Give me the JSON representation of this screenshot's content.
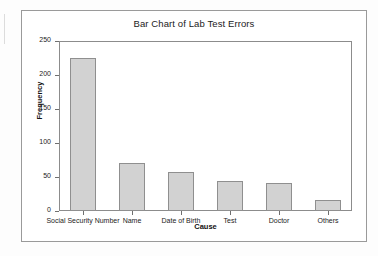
{
  "figure": {
    "title": "Bar Chart of Lab Test Errors"
  },
  "chart_data": {
    "type": "bar",
    "title": "Bar Chart of Lab Test Errors",
    "xlabel": "Cause",
    "ylabel": "Frequency",
    "categories": [
      "Social Security Number",
      "Name",
      "Date of Birth",
      "Test",
      "Doctor",
      "Others"
    ],
    "values": [
      225,
      70,
      58,
      44,
      41,
      16
    ],
    "ylim": [
      0,
      250
    ],
    "yticks": [
      0,
      50,
      100,
      150,
      200,
      250
    ],
    "ytick_labels": [
      "0",
      "50",
      "100",
      "150",
      "200",
      "250"
    ],
    "grid": false,
    "legend": null,
    "bar_fill_color": "#d2d2d2",
    "bar_edge_color": "#8f8f8f",
    "axis_color": "#8c8c8c",
    "background_color": "#ffffff"
  }
}
